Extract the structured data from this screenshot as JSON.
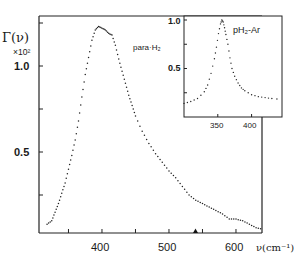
{
  "chart_data": [
    {
      "type": "scatter",
      "title": "",
      "annotation": "para-H2",
      "ylabel": "Γ(ν) ×10²",
      "xlabel": "ν(cm⁻¹)",
      "xlim": [
        306,
        645
      ],
      "ylim": [
        0,
        1.3
      ],
      "x_ticks": [
        400,
        500,
        600
      ],
      "x_minor_ticks": [
        350,
        450,
        550
      ],
      "y_ticks": [
        0.5,
        1.0
      ],
      "y_minor_ticks": [
        0.25,
        0.75,
        1.25
      ],
      "grid": false,
      "marker": "▲ at ν≈585",
      "series": [
        {
          "name": "para-H2",
          "x": [
            318,
            325,
            330,
            335,
            340,
            345,
            350,
            355,
            360,
            365,
            370,
            375,
            380,
            385,
            390,
            395,
            400,
            405,
            410,
            415,
            420,
            425,
            430,
            435,
            440,
            445,
            450,
            460,
            470,
            480,
            490,
            500,
            510,
            520,
            530,
            540,
            550,
            560,
            570,
            580,
            590,
            600,
            610,
            620,
            630,
            640
          ],
          "y": [
            0.08,
            0.1,
            0.15,
            0.2,
            0.26,
            0.32,
            0.4,
            0.48,
            0.57,
            0.68,
            0.82,
            0.95,
            1.05,
            1.15,
            1.21,
            1.23,
            1.22,
            1.21,
            1.19,
            1.18,
            1.12,
            1.04,
            0.97,
            0.9,
            0.83,
            0.77,
            0.71,
            0.62,
            0.55,
            0.49,
            0.44,
            0.39,
            0.35,
            0.3,
            0.25,
            0.22,
            0.2,
            0.18,
            0.16,
            0.14,
            0.11,
            0.11,
            0.1,
            0.08,
            0.06,
            0.05
          ]
        }
      ]
    },
    {
      "type": "scatter",
      "title": "",
      "annotation": "pH2-Ar",
      "xlabel": "",
      "ylabel": "",
      "x_ticks": [
        350,
        400
      ],
      "y_ticks": [
        0.5,
        1.0
      ],
      "y_minor_ticks": [
        0.25,
        0.75
      ],
      "xlim": [
        300,
        445
      ],
      "ylim": [
        0,
        1.05
      ],
      "grid": false,
      "series": [
        {
          "name": "pH2-Ar",
          "x": [
            300,
            310,
            320,
            330,
            335,
            340,
            345,
            348,
            351,
            354,
            356,
            358,
            360,
            362,
            365,
            368,
            371,
            375,
            380,
            385,
            390,
            400,
            410,
            420,
            430,
            445
          ],
          "y": [
            0.14,
            0.16,
            0.19,
            0.26,
            0.33,
            0.45,
            0.6,
            0.72,
            0.86,
            0.96,
            1.0,
            0.98,
            0.92,
            0.85,
            0.75,
            0.61,
            0.5,
            0.42,
            0.35,
            0.3,
            0.27,
            0.23,
            0.21,
            0.2,
            0.19,
            0.18
          ]
        }
      ]
    }
  ],
  "labels": {
    "y_axis_symbol": "Γ(ν)",
    "y_axis_scale": "×10²",
    "y_tick_1": "1.0",
    "y_tick_05": "0.5",
    "x_tick_400": "400",
    "x_tick_500": "500",
    "x_tick_600": "600",
    "x_axis_label": "ν(cm⁻¹)",
    "main_annotation": "para·H₂",
    "inset_annotation": "pH₂-Ar",
    "inset_y_1": "1.0",
    "inset_y_05": "0.5",
    "inset_x_350": "350",
    "inset_x_400": "400"
  }
}
